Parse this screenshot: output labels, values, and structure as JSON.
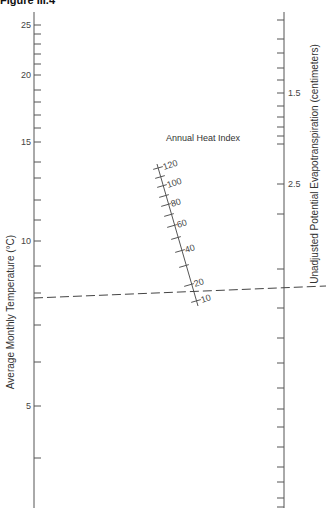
{
  "figure": {
    "title": "Figure III.4"
  },
  "chart_data": {
    "type": "nomogram",
    "title": "Figure III.4",
    "scales": [
      {
        "name": "Average Monthly Temperature (°C)",
        "position": "left",
        "labeled_ticks": [
          25,
          20,
          15,
          10,
          5
        ],
        "ticks": [
          {
            "v": 25,
            "y": 25
          },
          {
            "v": 24,
            "y": 34
          },
          {
            "v": 23,
            "y": 44
          },
          {
            "v": 22,
            "y": 54
          },
          {
            "v": 21,
            "y": 64
          },
          {
            "v": 20,
            "y": 75
          },
          {
            "v": 19,
            "y": 90
          },
          {
            "v": 18,
            "y": 102
          },
          {
            "v": 17,
            "y": 115
          },
          {
            "v": 16,
            "y": 128
          },
          {
            "v": 15,
            "y": 142
          },
          {
            "v": 14,
            "y": 162
          },
          {
            "v": 13,
            "y": 178
          },
          {
            "v": 12,
            "y": 200
          },
          {
            "v": 11,
            "y": 220
          },
          {
            "v": 10,
            "y": 241
          },
          {
            "v": 9,
            "y": 266
          },
          {
            "v": 8,
            "y": 293
          },
          {
            "v": 7,
            "y": 325
          },
          {
            "v": 6,
            "y": 362
          },
          {
            "v": 5,
            "y": 406
          },
          {
            "v": 4,
            "y": 458
          }
        ]
      },
      {
        "name": "Annual Heat Index",
        "position": "middle (oblique)",
        "labeled_ticks": [
          120,
          100,
          80,
          60,
          40,
          20,
          10
        ],
        "ticks": [
          {
            "v": 120,
            "x": 158,
            "y": 168
          },
          {
            "v": 110,
            "x": 160,
            "y": 177
          },
          {
            "v": 100,
            "x": 162,
            "y": 186
          },
          {
            "v": 90,
            "x": 164,
            "y": 196
          },
          {
            "v": 80,
            "x": 166,
            "y": 205
          },
          {
            "v": 70,
            "x": 169,
            "y": 215
          },
          {
            "v": 60,
            "x": 172,
            "y": 226
          },
          {
            "v": 50,
            "x": 176,
            "y": 238
          },
          {
            "v": 40,
            "x": 180,
            "y": 251
          },
          {
            "v": 30,
            "x": 184,
            "y": 266
          },
          {
            "v": 20,
            "x": 189,
            "y": 285
          },
          {
            "v": 10,
            "x": 196,
            "y": 301
          }
        ]
      },
      {
        "name": "Unadjusted Potential Evapotranspiration (centimeters)",
        "position": "right",
        "labeled_ticks": [
          "1.0",
          "1.5",
          "2.0",
          "2.5",
          "3.0",
          "4.0",
          "5.0",
          "6.0",
          "7.0",
          "8.0",
          "9.0",
          "10.0",
          "15.0"
        ],
        "ticks": [
          {
            "v": 1.0,
            "y": 20
          },
          {
            "v": 1.1,
            "y": 39
          },
          {
            "v": 1.2,
            "y": 53
          },
          {
            "v": 1.3,
            "y": 68
          },
          {
            "v": 1.4,
            "y": 80
          },
          {
            "v": 1.5,
            "y": 93
          },
          {
            "v": 1.6,
            "y": 106
          },
          {
            "v": 1.7,
            "y": 117
          },
          {
            "v": 1.8,
            "y": 127
          },
          {
            "v": 1.9,
            "y": 136
          },
          {
            "v": 2.0,
            "y": 144
          },
          {
            "v": 2.5,
            "y": 184
          },
          {
            "v": 3.0,
            "y": 214
          },
          {
            "v": 4.0,
            "y": 269
          },
          {
            "v": 5.0,
            "y": 308
          },
          {
            "v": 6.0,
            "y": 338
          },
          {
            "v": 7.0,
            "y": 363
          },
          {
            "v": 8.0,
            "y": 388
          },
          {
            "v": 9.0,
            "y": 409
          },
          {
            "v": 10.0,
            "y": 427
          },
          {
            "v": 11.0,
            "y": 447
          },
          {
            "v": 12.0,
            "y": 467
          },
          {
            "v": 13.0,
            "y": 482
          },
          {
            "v": 14.0,
            "y": 498
          },
          {
            "v": 15.0,
            "y": 507
          }
        ]
      }
    ],
    "example_line": {
      "style": "dashed",
      "temperature": 7.6,
      "heat_index": 20,
      "evapotranspiration": 4.5,
      "from": [
        34,
        298
      ],
      "to": [
        326,
        286
      ]
    },
    "xlabel": "",
    "ylabel_left": "Average Monthly Temperature (°C)",
    "ylabel_right": "Unadjusted Potential Evapotranspiration (centimeters)",
    "middle_label": "Annual Heat Index",
    "grid": false
  }
}
